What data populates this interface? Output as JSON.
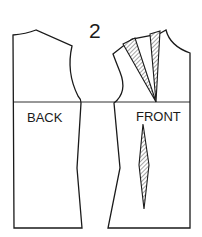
{
  "figure": {
    "number_label": "2",
    "pieces": [
      {
        "id": "back",
        "label": "BACK"
      },
      {
        "id": "front",
        "label": "FRONT"
      }
    ],
    "darts": [
      {
        "piece": "front",
        "location": "shoulder",
        "count": 2,
        "style": "hatched"
      },
      {
        "piece": "front",
        "location": "waist",
        "count": 1,
        "style": "hatched"
      }
    ],
    "colors": {
      "line": "#1a1a1a",
      "background": "#ffffff"
    }
  }
}
